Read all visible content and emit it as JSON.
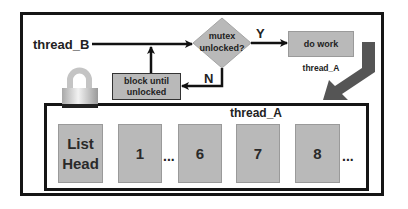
{
  "diagram": {
    "outer_frame": {
      "label": ""
    },
    "thread_b_label": "thread_B",
    "decision": {
      "line1": "mutex",
      "line2": "unlocked?"
    },
    "yes_label": "Y",
    "no_label": "N",
    "do_work": {
      "label": "do work",
      "owner": "thread_A"
    },
    "block": {
      "line1": "block until",
      "line2": "unlocked"
    },
    "lock_icon": "padlock-icon",
    "inner_frame": {
      "title": "thread_A"
    },
    "list": {
      "head": {
        "line1": "List",
        "line2": "Head"
      },
      "nodes": [
        "1",
        "6",
        "7",
        "8"
      ],
      "ellipsis": "..."
    },
    "colors": {
      "box_fill": "#b9b9b9",
      "frame": "#151515",
      "big_arrow": "#555555",
      "lock_body": "#c8c8c8"
    }
  }
}
